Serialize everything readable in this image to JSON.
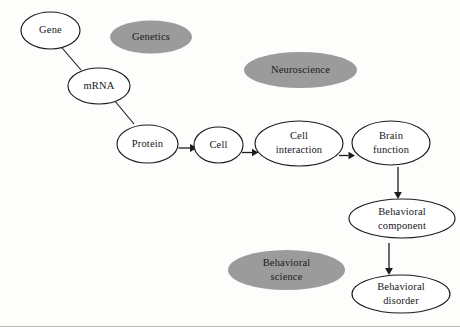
{
  "diagram": {
    "colors": {
      "background": "#fdfdfc",
      "node_fill_open": "#ffffff",
      "node_fill_shaded": "#9b9b9b",
      "stroke": "#1c1c1c",
      "text": "#16161a"
    },
    "nodes": [
      {
        "id": "gene",
        "label": "Gene",
        "lines": [
          "Gene"
        ],
        "style": "open",
        "cx": 50.5,
        "cy": 30.5,
        "rx": 29.5,
        "ry": 18.5
      },
      {
        "id": "genetics",
        "label": "Genetics",
        "lines": [
          "Genetics"
        ],
        "style": "shaded",
        "cx": 151,
        "cy": 37,
        "rx": 41,
        "ry": 16.5
      },
      {
        "id": "mrna",
        "label": "mRNA",
        "lines": [
          "mRNA"
        ],
        "style": "open",
        "cx": 99,
        "cy": 86,
        "rx": 31,
        "ry": 18
      },
      {
        "id": "neuroscience",
        "label": "Neuroscience",
        "lines": [
          "Neuroscience"
        ],
        "style": "shaded",
        "cx": 300.5,
        "cy": 70,
        "rx": 56.5,
        "ry": 18
      },
      {
        "id": "protein",
        "label": "Protein",
        "lines": [
          "Protein"
        ],
        "style": "open",
        "cx": 147.5,
        "cy": 144,
        "rx": 30.5,
        "ry": 19
      },
      {
        "id": "cell",
        "label": "Cell",
        "lines": [
          "Cell"
        ],
        "style": "open",
        "cx": 218.5,
        "cy": 145,
        "rx": 24.5,
        "ry": 18
      },
      {
        "id": "cell-interaction",
        "label": "Cell interaction",
        "lines": [
          "Cell",
          "interaction"
        ],
        "style": "open",
        "cx": 299,
        "cy": 143.5,
        "rx": 44,
        "ry": 22.5
      },
      {
        "id": "brain-function",
        "label": "Brain function",
        "lines": [
          "Brain",
          "function"
        ],
        "style": "open",
        "cx": 391,
        "cy": 143,
        "rx": 39,
        "ry": 22
      },
      {
        "id": "behavioral-component",
        "label": "Behavioral component",
        "lines": [
          "Behavioral",
          "component"
        ],
        "style": "open",
        "cx": 402,
        "cy": 218.5,
        "rx": 53,
        "ry": 19.5
      },
      {
        "id": "behavioral-science",
        "label": "Behavioral science",
        "lines": [
          "Behavioral",
          "science"
        ],
        "style": "shaded",
        "cx": 286.5,
        "cy": 270,
        "rx": 58.5,
        "ry": 20
      },
      {
        "id": "behavioral-disorder",
        "label": "Behavioral disorder",
        "lines": [
          "Behavioral",
          "disorder"
        ],
        "style": "open",
        "cx": 401,
        "cy": 294,
        "rx": 49,
        "ry": 19
      }
    ],
    "edges": [
      {
        "id": "gene-to-mrna",
        "from": "gene",
        "to": "mrna",
        "type": "plain-line",
        "x1": 60,
        "y1": 45.5,
        "x2": 81,
        "y2": 70
      },
      {
        "id": "mrna-to-protein",
        "from": "mrna",
        "to": "protein",
        "type": "plain-line",
        "x1": 114,
        "y1": 100,
        "x2": 134,
        "y2": 124
      },
      {
        "id": "protein-to-cell",
        "from": "protein",
        "to": "cell",
        "type": "arrow-right",
        "x1": 178.5,
        "y1": 148,
        "x2": 193,
        "y2": 148
      },
      {
        "id": "cell-to-cell-interaction",
        "from": "cell",
        "to": "cell-interaction",
        "type": "arrow-right",
        "x1": 243,
        "y1": 152.5,
        "x2": 255.5,
        "y2": 152.5
      },
      {
        "id": "cell-interaction-to-brain-function",
        "from": "cell-interaction",
        "to": "brain-function",
        "type": "arrow-right",
        "x1": 339,
        "y1": 155.5,
        "x2": 352,
        "y2": 155.5
      },
      {
        "id": "brain-function-to-behavioral-component",
        "from": "brain-function",
        "to": "behavioral-component",
        "type": "arrow-down",
        "x1": 398,
        "y1": 167,
        "x2": 398,
        "y2": 198
      },
      {
        "id": "behavioral-component-to-behavioral-disorder",
        "from": "behavioral-component",
        "to": "behavioral-disorder",
        "type": "arrow-down",
        "x1": 389,
        "y1": 243,
        "x2": 389,
        "y2": 274
      }
    ]
  }
}
